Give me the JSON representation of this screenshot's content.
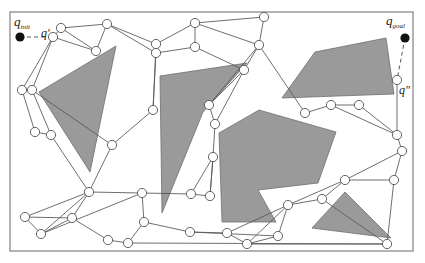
{
  "diagram": {
    "colors": {
      "obstacle": "#9a9a9a",
      "edge": "#555555",
      "node_fill": "#ffffff",
      "endpoint": "#111111",
      "frame": "#8a8a8a"
    },
    "labels": {
      "q_init": {
        "main": "q",
        "sub": "init"
      },
      "q_goal": {
        "main": "q",
        "sub": "goal"
      },
      "q_prime": "q′",
      "q_double_prime": "q″"
    },
    "endpoints": {
      "q_init": [
        20,
        37
      ],
      "q_goal": [
        405,
        38
      ]
    },
    "obstacles": [
      {
        "id": "triangle-left",
        "points": [
          [
            39,
            92
          ],
          [
            116,
            46
          ],
          [
            90,
            172
          ]
        ]
      },
      {
        "id": "polygon-left-center",
        "points": [
          [
            160,
            76
          ],
          [
            247,
            63
          ],
          [
            203,
            112
          ],
          [
            162,
            213
          ]
        ]
      },
      {
        "id": "quad-top-right",
        "points": [
          [
            282,
            98
          ],
          [
            315,
            52
          ],
          [
            386,
            38
          ],
          [
            394,
            94
          ]
        ]
      },
      {
        "id": "polygon-center",
        "points": [
          [
            219,
            133
          ],
          [
            259,
            110
          ],
          [
            336,
            132
          ],
          [
            318,
            183
          ],
          [
            258,
            190
          ],
          [
            276,
            222
          ],
          [
            222,
            222
          ]
        ]
      },
      {
        "id": "triangle-bottom-right",
        "points": [
          [
            312,
            228
          ],
          [
            345,
            192
          ],
          [
            391,
            238
          ]
        ]
      }
    ],
    "nodes": [
      [
        53,
        37
      ],
      [
        61,
        28
      ],
      [
        107,
        24
      ],
      [
        96,
        51
      ],
      [
        22,
        90
      ],
      [
        32,
        90
      ],
      [
        35,
        132
      ],
      [
        51,
        135
      ],
      [
        112,
        145
      ],
      [
        89,
        192
      ],
      [
        142,
        193
      ],
      [
        25,
        217
      ],
      [
        72,
        218
      ],
      [
        41,
        234
      ],
      [
        108,
        240
      ],
      [
        128,
        243
      ],
      [
        144,
        222
      ],
      [
        191,
        194
      ],
      [
        210,
        196
      ],
      [
        190,
        232
      ],
      [
        227,
        233
      ],
      [
        247,
        244
      ],
      [
        156,
        44
      ],
      [
        156,
        53
      ],
      [
        195,
        23
      ],
      [
        264,
        17
      ],
      [
        259,
        45
      ],
      [
        195,
        47
      ],
      [
        244,
        70
      ],
      [
        153,
        110
      ],
      [
        209,
        105
      ],
      [
        215,
        124
      ],
      [
        213,
        157
      ],
      [
        397,
        80
      ],
      [
        305,
        113
      ],
      [
        331,
        105
      ],
      [
        359,
        105
      ],
      [
        397,
        135
      ],
      [
        402,
        151
      ],
      [
        345,
        180
      ],
      [
        394,
        180
      ],
      [
        322,
        199
      ],
      [
        288,
        205
      ],
      [
        387,
        244
      ],
      [
        278,
        236
      ]
    ],
    "edges": [
      [
        0,
        1
      ],
      [
        1,
        2
      ],
      [
        1,
        3
      ],
      [
        0,
        3
      ],
      [
        2,
        3
      ],
      [
        0,
        4
      ],
      [
        0,
        5
      ],
      [
        4,
        6
      ],
      [
        5,
        7
      ],
      [
        6,
        7
      ],
      [
        5,
        8
      ],
      [
        7,
        9
      ],
      [
        8,
        9
      ],
      [
        9,
        10
      ],
      [
        9,
        11
      ],
      [
        9,
        12
      ],
      [
        11,
        12
      ],
      [
        11,
        13
      ],
      [
        12,
        13
      ],
      [
        9,
        13
      ],
      [
        12,
        14
      ],
      [
        14,
        15
      ],
      [
        15,
        16
      ],
      [
        13,
        10
      ],
      [
        10,
        16
      ],
      [
        10,
        17
      ],
      [
        17,
        18
      ],
      [
        16,
        19
      ],
      [
        19,
        20
      ],
      [
        20,
        21
      ],
      [
        2,
        22
      ],
      [
        2,
        23
      ],
      [
        22,
        23
      ],
      [
        22,
        24
      ],
      [
        23,
        27
      ],
      [
        24,
        27
      ],
      [
        24,
        25
      ],
      [
        25,
        26
      ],
      [
        24,
        26
      ],
      [
        27,
        28
      ],
      [
        23,
        29
      ],
      [
        22,
        29
      ],
      [
        29,
        8
      ],
      [
        28,
        30
      ],
      [
        28,
        31
      ],
      [
        30,
        31
      ],
      [
        31,
        32
      ],
      [
        32,
        18
      ],
      [
        26,
        28
      ],
      [
        26,
        30
      ],
      [
        26,
        34
      ],
      [
        34,
        35
      ],
      [
        35,
        36
      ],
      [
        35,
        37
      ],
      [
        36,
        37
      ],
      [
        37,
        38
      ],
      [
        33,
        37
      ],
      [
        38,
        39
      ],
      [
        38,
        40
      ],
      [
        39,
        40
      ],
      [
        39,
        41
      ],
      [
        41,
        42
      ],
      [
        39,
        42
      ],
      [
        42,
        20
      ],
      [
        42,
        21
      ],
      [
        21,
        43
      ],
      [
        43,
        15
      ],
      [
        40,
        43
      ],
      [
        41,
        43
      ],
      [
        32,
        18
      ],
      [
        17,
        32
      ],
      [
        44,
        21
      ],
      [
        44,
        42
      ],
      [
        19,
        44
      ]
    ],
    "dashed_links": [
      {
        "from": "q_init",
        "to_node": 0
      },
      {
        "from": "q_goal",
        "to_node": 33
      }
    ]
  }
}
